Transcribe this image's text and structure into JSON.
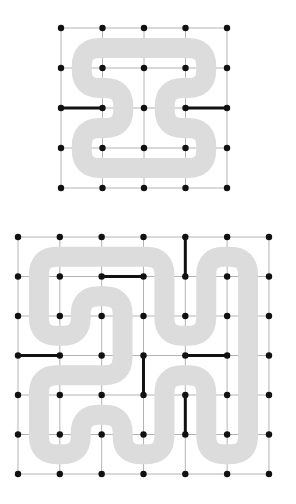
{
  "colors": {
    "background": "#ffffff",
    "grid_line": "#b4b4b4",
    "path_band": "#dcdcdc",
    "dot": "#111111",
    "highlight_edge": "#111111"
  },
  "diagrams": [
    {
      "name": "small-grid",
      "dots_cols": 5,
      "dots_rows": 5,
      "origin": [
        61,
        28
      ],
      "spacing": [
        41.5,
        40
      ],
      "band_width": 20,
      "corner_radius": 18,
      "loop_cells": [
        [
          0,
          0
        ],
        [
          3,
          0
        ],
        [
          3,
          1
        ],
        [
          2,
          1
        ],
        [
          2,
          2
        ],
        [
          3,
          2
        ],
        [
          3,
          3
        ],
        [
          0,
          3
        ],
        [
          0,
          2
        ],
        [
          1,
          2
        ],
        [
          1,
          1
        ],
        [
          0,
          1
        ]
      ],
      "black_edges": [
        [
          [
            0,
            2
          ],
          [
            1,
            2
          ]
        ],
        [
          [
            3,
            2
          ],
          [
            4,
            2
          ]
        ]
      ]
    },
    {
      "name": "large-grid",
      "dots_cols": 7,
      "dots_rows": 7,
      "origin": [
        18,
        237
      ],
      "spacing": [
        41.83,
        39.5
      ],
      "band_width": 20,
      "corner_radius": 18,
      "loop_cells": [
        [
          0,
          0
        ],
        [
          3,
          0
        ],
        [
          3,
          2
        ],
        [
          4,
          2
        ],
        [
          4,
          0
        ],
        [
          5,
          0
        ],
        [
          5,
          5
        ],
        [
          4,
          5
        ],
        [
          4,
          3
        ],
        [
          3,
          3
        ],
        [
          3,
          5
        ],
        [
          2,
          5
        ],
        [
          2,
          4
        ],
        [
          1,
          4
        ],
        [
          1,
          5
        ],
        [
          0,
          5
        ],
        [
          0,
          3
        ],
        [
          2,
          3
        ],
        [
          2,
          1
        ],
        [
          1,
          1
        ],
        [
          1,
          2
        ],
        [
          0,
          2
        ]
      ],
      "black_edges": [
        [
          [
            4,
            0
          ],
          [
            4,
            1
          ]
        ],
        [
          [
            2,
            1
          ],
          [
            3,
            1
          ]
        ],
        [
          [
            0,
            3
          ],
          [
            1,
            3
          ]
        ],
        [
          [
            3,
            3
          ],
          [
            3,
            4
          ]
        ],
        [
          [
            4,
            3
          ],
          [
            5,
            3
          ]
        ],
        [
          [
            4,
            4
          ],
          [
            4,
            5
          ]
        ]
      ]
    }
  ]
}
